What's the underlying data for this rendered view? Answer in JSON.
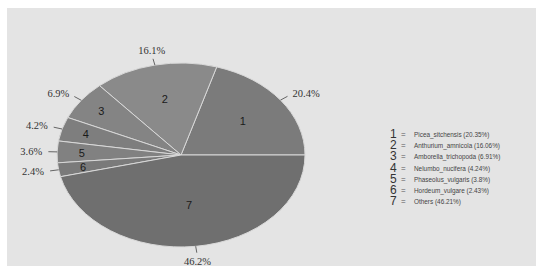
{
  "chart_data": {
    "type": "pie",
    "title": "",
    "slices": [
      {
        "index": "1",
        "label": "Picea_sitchensis",
        "value": 20.35,
        "display": "20.4%",
        "legend": "Picea_sitchensis (20.35%)",
        "color": "#7b7b7b"
      },
      {
        "index": "2",
        "label": "Anthurium_amnicola",
        "value": 16.06,
        "display": "16.1%",
        "legend": "Anthurium_amnicola (16.06%)",
        "color": "#8a8a8a"
      },
      {
        "index": "3",
        "label": "Amborella_trichopoda",
        "value": 6.91,
        "display": "6.9%",
        "legend": "Amborella_trichopoda (6.91%)",
        "color": "#848484"
      },
      {
        "index": "4",
        "label": "Nelumbo_nucifera",
        "value": 4.24,
        "display": "4.2%",
        "legend": "Nelumbo_nucifera (4.24%)",
        "color": "#7e7e7e"
      },
      {
        "index": "5",
        "label": "Phaseolus_vulgaris",
        "value": 3.8,
        "display": "3.6%",
        "legend": "Phaseolus_vulgaris (3.8%)",
        "color": "#818181"
      },
      {
        "index": "6",
        "label": "Hordeum_vulgare",
        "value": 2.43,
        "display": "2.4%",
        "legend": "Hordeum_vulgare (2.43%)",
        "color": "#7a7a7a"
      },
      {
        "index": "7",
        "label": "Others",
        "value": 46.21,
        "display": "46.2%",
        "legend": "Others (46.21%)",
        "color": "#6f6f6f"
      }
    ],
    "legend_position": "right",
    "start_angle_deg": 0,
    "direction": "counterclockwise",
    "background": "#e4e4e4"
  },
  "legend": {
    "items": [
      {
        "idx": "1",
        "eq": "=",
        "text": "Picea_sitchensis (20.35%)"
      },
      {
        "idx": "2",
        "eq": "=",
        "text": "Anthurium_amnicola (16.06%)"
      },
      {
        "idx": "3",
        "eq": "=",
        "text": "Amborella_trichopoda (6.91%)"
      },
      {
        "idx": "4",
        "eq": "=",
        "text": "Nelumbo_nucifera (4.24%)"
      },
      {
        "idx": "5",
        "eq": "=",
        "text": "Phaseolus_vulgaris (3.8%)"
      },
      {
        "idx": "6",
        "eq": "=",
        "text": "Hordeum_vulgare (2.43%)"
      },
      {
        "idx": "7",
        "eq": "=",
        "text": "Others (46.21%)"
      }
    ]
  }
}
